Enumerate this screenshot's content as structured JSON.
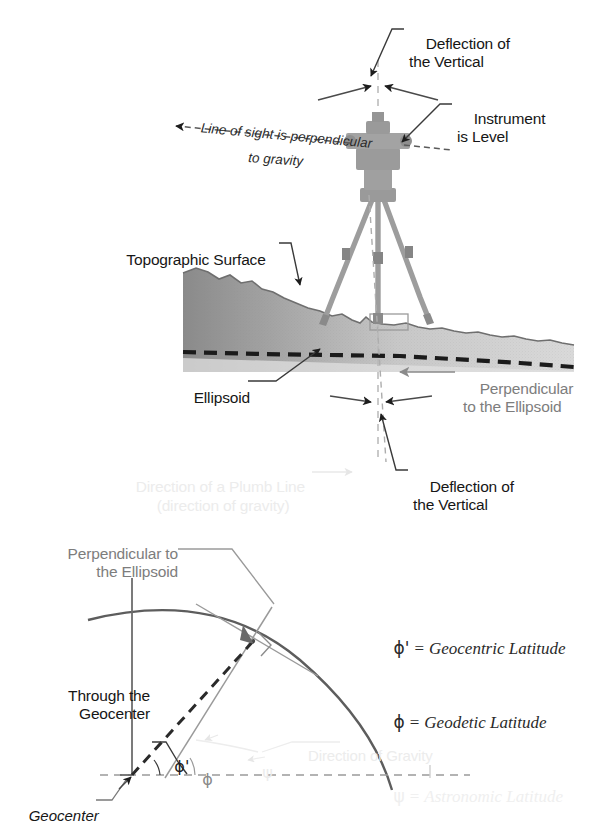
{
  "figure": {
    "panels": [
      "upper-instrument-panel",
      "lower-ellipsoid-panel"
    ]
  },
  "upper": {
    "deflection_top": "Deflection of\nthe Vertical",
    "instrument_level": "Instrument\nis Level",
    "line_of_sight_1": "Line of sight is perpendicular",
    "line_of_sight_2": "to gravity",
    "topographic_surface": "Topographic Surface",
    "ellipsoid": "Ellipsoid",
    "perpendicular_ellipsoid": "Perpendicular\nto the Ellipsoid",
    "deflection_bottom": "Deflection of\nthe Vertical",
    "plumb_line_1": "Direction of a Plumb Line",
    "plumb_line_2": "(direction of gravity)"
  },
  "lower": {
    "perpendicular_ellipsoid": "Perpendicular to\nthe Ellipsoid",
    "through_geocenter": "Through the\nGeocenter",
    "geocenter": "Geocenter",
    "direction_of_gravity": "Direction of Gravity",
    "angle_geocentric": "ϕ'",
    "angle_geodetic": "ϕ",
    "angle_astronomic": "ψ"
  },
  "legend": {
    "items": [
      {
        "symbol": "ϕ'",
        "equals": "=",
        "definition": "Geocentric Latitude",
        "faded": false
      },
      {
        "symbol": "ϕ",
        "equals": "=",
        "definition": "Geodetic Latitude",
        "faded": false
      },
      {
        "symbol": "ψ",
        "equals": "=",
        "definition": "Astronomic Latitude",
        "faded": true
      }
    ]
  },
  "colors": {
    "ink": "#161616",
    "gray_text": "#7d7d7d",
    "faint_text": "#ececec",
    "terrain_dark": "#8e8e8e",
    "terrain_light": "#cfcfcf",
    "dashed_ellipsoid": "#1d1d1d",
    "instrument": "#909090"
  }
}
